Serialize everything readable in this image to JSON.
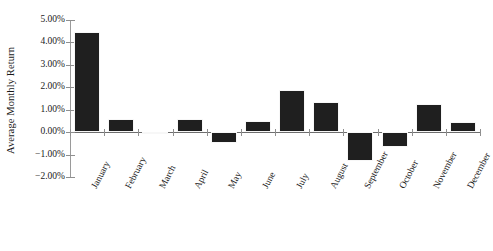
{
  "chart_data": {
    "type": "bar",
    "title": "",
    "xlabel": "",
    "ylabel": "Average Monthly Return",
    "categories": [
      "January",
      "February",
      "March",
      "April",
      "May",
      "June",
      "July",
      "August",
      "September",
      "October",
      "November",
      "December"
    ],
    "values": [
      4.45,
      0.6,
      -0.1,
      0.6,
      -0.5,
      0.5,
      1.9,
      1.35,
      -1.3,
      -0.65,
      1.25,
      0.45
    ],
    "value_unit": "%",
    "ylim": [
      -2.0,
      5.0
    ],
    "ytick_values": [
      5.0,
      4.0,
      3.0,
      2.0,
      1.0,
      0.0,
      -1.0,
      -2.0
    ],
    "ytick_labels": [
      "5.00%",
      "4.00%",
      "3.00%",
      "2.00%",
      "1.00%",
      "0.00%",
      "−1.00%",
      "−2.00%"
    ],
    "grid": false,
    "legend": false,
    "bar_color": "#1f1f1f",
    "axis_color": "#8f8f8f",
    "background_color": "#ffffff"
  }
}
